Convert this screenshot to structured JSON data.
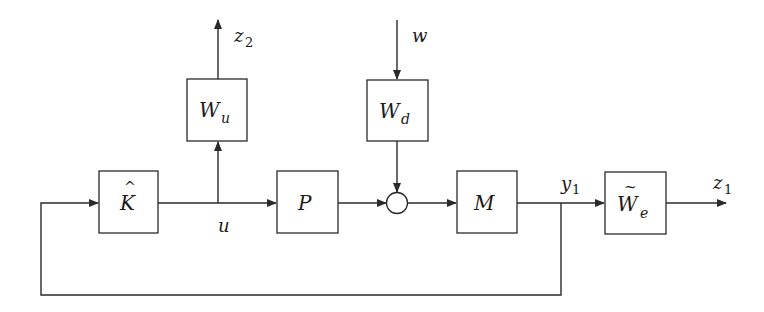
{
  "diagram": {
    "type": "block-diagram",
    "title": "",
    "blocks": [
      {
        "id": "K",
        "main": "K",
        "accent": "^",
        "sub": ""
      },
      {
        "id": "Wu",
        "main": "W",
        "accent": "",
        "sub": "u"
      },
      {
        "id": "Wd",
        "main": "W",
        "accent": "",
        "sub": "d"
      },
      {
        "id": "P",
        "main": "P",
        "accent": "",
        "sub": ""
      },
      {
        "id": "M",
        "main": "M",
        "accent": "",
        "sub": ""
      },
      {
        "id": "We",
        "main": "W",
        "accent": "~",
        "sub": "e"
      }
    ],
    "junctions": [
      {
        "id": "sum",
        "kind": "summing-circle"
      }
    ],
    "signals": {
      "u": {
        "main": "u",
        "sub": ""
      },
      "y1": {
        "main": "y",
        "sub": "1"
      },
      "z1": {
        "main": "z",
        "sub": "1"
      },
      "z2": {
        "main": "z",
        "sub": "2"
      },
      "w": {
        "main": "w",
        "sub": ""
      }
    },
    "edges": [
      {
        "from": "K",
        "to": "P",
        "label": "u"
      },
      {
        "from": "u-branch",
        "to": "Wu"
      },
      {
        "from": "Wu",
        "to": "out-z2",
        "label": "z2"
      },
      {
        "from": "in-w",
        "to": "Wd",
        "label": "w"
      },
      {
        "from": "Wd",
        "to": "sum"
      },
      {
        "from": "P",
        "to": "sum"
      },
      {
        "from": "sum",
        "to": "M"
      },
      {
        "from": "M",
        "to": "We",
        "label": "y1"
      },
      {
        "from": "We",
        "to": "out-z1",
        "label": "z1"
      },
      {
        "from": "y1-branch",
        "to": "K",
        "kind": "feedback"
      }
    ],
    "colors": {
      "stroke": "#2a2a2a",
      "background": "#ffffff",
      "text": "#1a1a1a"
    }
  }
}
